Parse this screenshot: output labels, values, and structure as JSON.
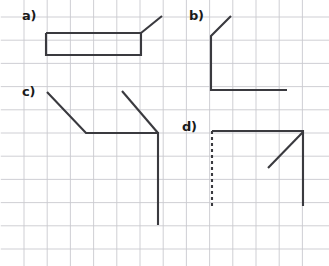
{
  "figure": {
    "width": 329,
    "height": 266,
    "background_color": "#ffffff"
  },
  "grid": {
    "line_color": "#c9c9cf",
    "line_width": 0.9,
    "cell_size": 23.2,
    "x_start": 24,
    "x_end": 325,
    "y_start": 17,
    "y_end": 258,
    "visible": true
  },
  "stroke": {
    "color": "#3a3a3f",
    "width": 2.1,
    "dash_pattern": "3 3"
  },
  "labels": [
    {
      "id": "a",
      "text": "a)",
      "x": 22,
      "y": 9
    },
    {
      "id": "b",
      "text": "b)",
      "x": 189,
      "y": 9
    },
    {
      "id": "c",
      "text": "c)",
      "x": 22,
      "y": 85
    },
    {
      "id": "d",
      "text": "d)",
      "x": 182,
      "y": 120
    }
  ],
  "panels": [
    {
      "id": "a",
      "name": "panel-a",
      "shapes": [
        {
          "kind": "polyline",
          "style": "solid",
          "points": "46,33 141,33 141,55 46,55 46,33"
        },
        {
          "kind": "polyline",
          "style": "solid",
          "points": "141,33 162,16"
        }
      ]
    },
    {
      "id": "b",
      "name": "panel-b",
      "shapes": [
        {
          "kind": "polyline",
          "style": "solid",
          "points": "231,16 211,36 211,90 287,90"
        }
      ]
    },
    {
      "id": "c",
      "name": "panel-c",
      "shapes": [
        {
          "kind": "polyline",
          "style": "solid",
          "points": "47,92 86,133 158,133 158,225"
        },
        {
          "kind": "polyline",
          "style": "solid",
          "points": "122,91 158,133"
        }
      ]
    },
    {
      "id": "d",
      "name": "panel-d",
      "shapes": [
        {
          "kind": "polyline",
          "style": "solid",
          "points": "212,131 303,131 303,206"
        },
        {
          "kind": "polyline",
          "style": "dashed",
          "points": "212,131 212,206"
        },
        {
          "kind": "polyline",
          "style": "solid",
          "points": "268,168 303,132"
        }
      ]
    }
  ]
}
